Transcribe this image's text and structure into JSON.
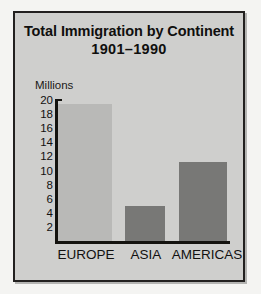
{
  "chart_data": {
    "type": "bar",
    "title": "Total Immigration by Continent",
    "subtitle": "1901–1990",
    "ylabel": "Millions",
    "xlabel": "",
    "categories": [
      "EUROPE",
      "ASIA",
      "AMERICAS"
    ],
    "values": [
      19.5,
      5.0,
      11.2
    ],
    "series": [
      {
        "name": "Total Immigration",
        "values": [
          19.5,
          5.0,
          11.2
        ]
      }
    ],
    "ylim": [
      0,
      20
    ],
    "ytick_labels": [
      "20",
      "18",
      "16",
      "14",
      "12",
      "10",
      "8",
      "6",
      "4",
      "2"
    ],
    "ytick_values": [
      20,
      18,
      16,
      14,
      12,
      10,
      8,
      6,
      4,
      2
    ],
    "grid": false,
    "legend": false,
    "legend_position": "none",
    "bar_colors": [
      "#b9b9b7",
      "#787876",
      "#787876"
    ],
    "plot_background": "#cfcfcd",
    "axis_color": "#14130f",
    "text_color": "#121110",
    "frame_border_color": "#22201f"
  }
}
